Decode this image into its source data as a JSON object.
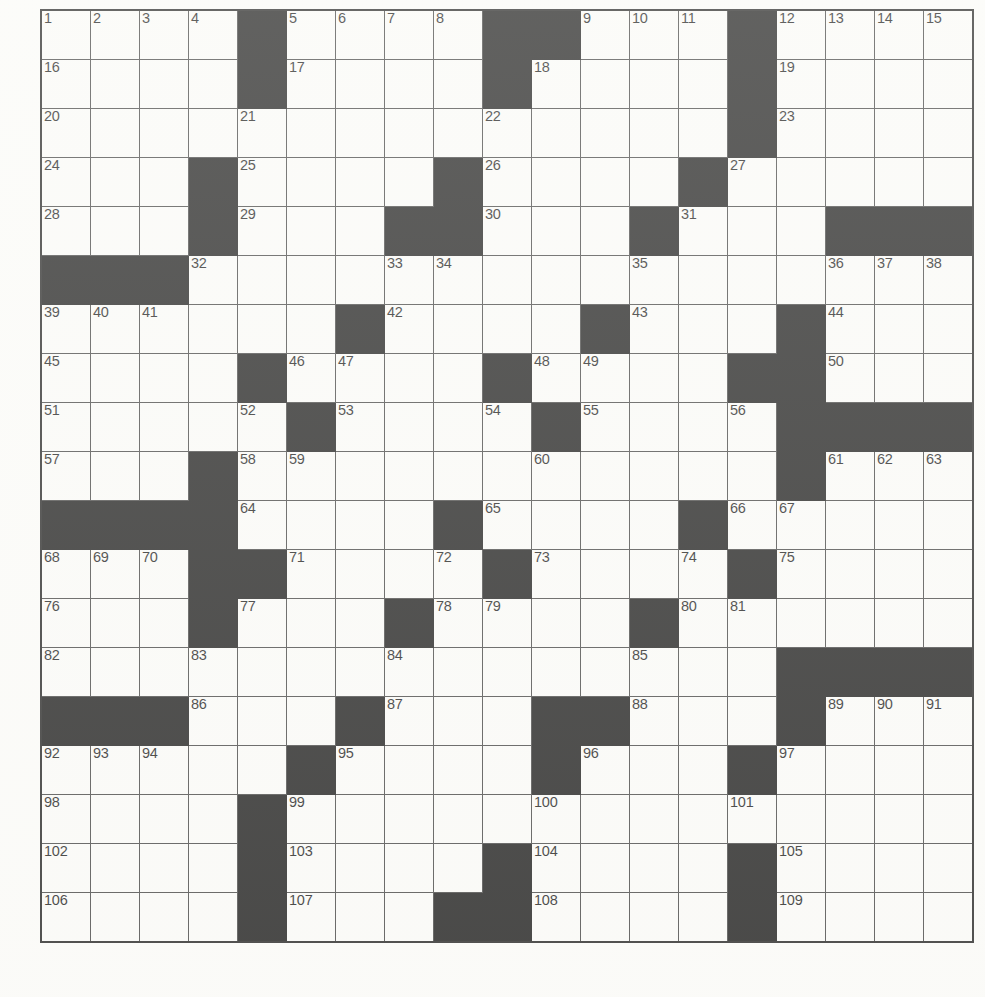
{
  "document": {
    "type": "crossword-puzzle-grid",
    "title": "Crossword Puzzle Grid",
    "rows": 19,
    "cols": 19,
    "colors": {
      "block": "#101010",
      "cell": "#fcfcfa",
      "grid_line": "#3c3c3c",
      "number_text": "#111111"
    },
    "max_clue_number": 109
  },
  "grid": {
    "legend": {
      "0": "white-cell",
      "1": "black-block"
    },
    "cells": [
      [
        0,
        0,
        0,
        0,
        1,
        0,
        0,
        0,
        0,
        1,
        1,
        0,
        0,
        0,
        1,
        0,
        0,
        0,
        0
      ],
      [
        0,
        0,
        0,
        0,
        1,
        0,
        0,
        0,
        0,
        1,
        0,
        0,
        0,
        0,
        1,
        0,
        0,
        0,
        0
      ],
      [
        0,
        0,
        0,
        0,
        0,
        0,
        0,
        0,
        0,
        0,
        0,
        0,
        0,
        0,
        1,
        0,
        0,
        0,
        0
      ],
      [
        0,
        0,
        0,
        1,
        0,
        0,
        0,
        0,
        1,
        0,
        0,
        0,
        0,
        1,
        0,
        0,
        0,
        0,
        0
      ],
      [
        0,
        0,
        0,
        1,
        0,
        0,
        0,
        1,
        1,
        0,
        0,
        0,
        1,
        0,
        0,
        0,
        1,
        1,
        1
      ],
      [
        1,
        1,
        1,
        0,
        0,
        0,
        0,
        0,
        0,
        0,
        0,
        0,
        0,
        0,
        0,
        0,
        0,
        0,
        0
      ],
      [
        0,
        0,
        0,
        0,
        0,
        0,
        1,
        0,
        0,
        0,
        0,
        1,
        0,
        0,
        0,
        1,
        0,
        0,
        0
      ],
      [
        0,
        0,
        0,
        0,
        1,
        0,
        0,
        0,
        0,
        1,
        0,
        0,
        0,
        0,
        1,
        1,
        0,
        0,
        0
      ],
      [
        0,
        0,
        0,
        0,
        0,
        1,
        0,
        0,
        0,
        0,
        1,
        0,
        0,
        0,
        0,
        1,
        1,
        1,
        1
      ],
      [
        0,
        0,
        0,
        1,
        0,
        0,
        0,
        0,
        0,
        0,
        0,
        0,
        0,
        0,
        0,
        1,
        0,
        0,
        0
      ],
      [
        1,
        1,
        1,
        1,
        0,
        0,
        0,
        0,
        1,
        0,
        0,
        0,
        0,
        1,
        0,
        0,
        0,
        0,
        0
      ],
      [
        0,
        0,
        0,
        1,
        1,
        0,
        0,
        0,
        0,
        1,
        0,
        0,
        0,
        0,
        1,
        0,
        0,
        0,
        0
      ],
      [
        0,
        0,
        0,
        1,
        0,
        0,
        0,
        1,
        0,
        0,
        0,
        0,
        1,
        0,
        0,
        0,
        0,
        0,
        0
      ],
      [
        0,
        0,
        0,
        0,
        0,
        0,
        0,
        0,
        0,
        0,
        0,
        0,
        0,
        0,
        0,
        1,
        1,
        1,
        1
      ],
      [
        1,
        1,
        1,
        0,
        0,
        0,
        1,
        0,
        0,
        0,
        1,
        1,
        0,
        0,
        0,
        1,
        0,
        0,
        0
      ],
      [
        0,
        0,
        0,
        0,
        0,
        1,
        0,
        0,
        0,
        0,
        1,
        0,
        0,
        0,
        1,
        0,
        0,
        0,
        0
      ],
      [
        0,
        0,
        0,
        0,
        1,
        0,
        0,
        0,
        0,
        0,
        0,
        0,
        0,
        0,
        0,
        0,
        0,
        0,
        0
      ],
      [
        0,
        0,
        0,
        0,
        1,
        0,
        0,
        0,
        0,
        1,
        0,
        0,
        0,
        0,
        1,
        0,
        0,
        0,
        0
      ],
      [
        0,
        0,
        0,
        0,
        1,
        0,
        0,
        0,
        1,
        1,
        0,
        0,
        0,
        0,
        1,
        0,
        0,
        0,
        0
      ]
    ],
    "numbers": [
      {
        "r": 0,
        "c": 0,
        "n": "1"
      },
      {
        "r": 0,
        "c": 1,
        "n": "2"
      },
      {
        "r": 0,
        "c": 2,
        "n": "3"
      },
      {
        "r": 0,
        "c": 3,
        "n": "4"
      },
      {
        "r": 0,
        "c": 5,
        "n": "5"
      },
      {
        "r": 0,
        "c": 6,
        "n": "6"
      },
      {
        "r": 0,
        "c": 7,
        "n": "7"
      },
      {
        "r": 0,
        "c": 8,
        "n": "8"
      },
      {
        "r": 0,
        "c": 11,
        "n": "9"
      },
      {
        "r": 0,
        "c": 12,
        "n": "10"
      },
      {
        "r": 0,
        "c": 13,
        "n": "11"
      },
      {
        "r": 0,
        "c": 15,
        "n": "12"
      },
      {
        "r": 0,
        "c": 16,
        "n": "13"
      },
      {
        "r": 0,
        "c": 17,
        "n": "14"
      },
      {
        "r": 0,
        "c": 18,
        "n": "15"
      },
      {
        "r": 1,
        "c": 0,
        "n": "16"
      },
      {
        "r": 1,
        "c": 5,
        "n": "17"
      },
      {
        "r": 1,
        "c": 10,
        "n": "18"
      },
      {
        "r": 1,
        "c": 15,
        "n": "19"
      },
      {
        "r": 2,
        "c": 0,
        "n": "20"
      },
      {
        "r": 2,
        "c": 4,
        "n": "21"
      },
      {
        "r": 2,
        "c": 9,
        "n": "22"
      },
      {
        "r": 2,
        "c": 15,
        "n": "23"
      },
      {
        "r": 3,
        "c": 0,
        "n": "24"
      },
      {
        "r": 3,
        "c": 4,
        "n": "25"
      },
      {
        "r": 3,
        "c": 9,
        "n": "26"
      },
      {
        "r": 3,
        "c": 14,
        "n": "27"
      },
      {
        "r": 4,
        "c": 0,
        "n": "28"
      },
      {
        "r": 4,
        "c": 4,
        "n": "29"
      },
      {
        "r": 4,
        "c": 9,
        "n": "30"
      },
      {
        "r": 4,
        "c": 13,
        "n": "31"
      },
      {
        "r": 5,
        "c": 3,
        "n": "32"
      },
      {
        "r": 5,
        "c": 7,
        "n": "33"
      },
      {
        "r": 5,
        "c": 8,
        "n": "34"
      },
      {
        "r": 5,
        "c": 12,
        "n": "35"
      },
      {
        "r": 5,
        "c": 16,
        "n": "36"
      },
      {
        "r": 5,
        "c": 17,
        "n": "37"
      },
      {
        "r": 5,
        "c": 18,
        "n": "38"
      },
      {
        "r": 6,
        "c": 0,
        "n": "39"
      },
      {
        "r": 6,
        "c": 1,
        "n": "40"
      },
      {
        "r": 6,
        "c": 2,
        "n": "41"
      },
      {
        "r": 6,
        "c": 7,
        "n": "42"
      },
      {
        "r": 6,
        "c": 12,
        "n": "43"
      },
      {
        "r": 6,
        "c": 16,
        "n": "44"
      },
      {
        "r": 7,
        "c": 0,
        "n": "45"
      },
      {
        "r": 7,
        "c": 5,
        "n": "46"
      },
      {
        "r": 7,
        "c": 6,
        "n": "47"
      },
      {
        "r": 7,
        "c": 10,
        "n": "48"
      },
      {
        "r": 7,
        "c": 11,
        "n": "49"
      },
      {
        "r": 7,
        "c": 16,
        "n": "50"
      },
      {
        "r": 8,
        "c": 0,
        "n": "51"
      },
      {
        "r": 8,
        "c": 4,
        "n": "52"
      },
      {
        "r": 8,
        "c": 6,
        "n": "53"
      },
      {
        "r": 8,
        "c": 9,
        "n": "54"
      },
      {
        "r": 8,
        "c": 11,
        "n": "55"
      },
      {
        "r": 8,
        "c": 14,
        "n": "56"
      },
      {
        "r": 9,
        "c": 0,
        "n": "57"
      },
      {
        "r": 9,
        "c": 4,
        "n": "58"
      },
      {
        "r": 9,
        "c": 5,
        "n": "59"
      },
      {
        "r": 9,
        "c": 10,
        "n": "60"
      },
      {
        "r": 9,
        "c": 16,
        "n": "61"
      },
      {
        "r": 9,
        "c": 17,
        "n": "62"
      },
      {
        "r": 9,
        "c": 18,
        "n": "63"
      },
      {
        "r": 10,
        "c": 4,
        "n": "64"
      },
      {
        "r": 10,
        "c": 9,
        "n": "65"
      },
      {
        "r": 10,
        "c": 14,
        "n": "66"
      },
      {
        "r": 10,
        "c": 15,
        "n": "67"
      },
      {
        "r": 11,
        "c": 0,
        "n": "68"
      },
      {
        "r": 11,
        "c": 1,
        "n": "69"
      },
      {
        "r": 11,
        "c": 2,
        "n": "70"
      },
      {
        "r": 11,
        "c": 5,
        "n": "71"
      },
      {
        "r": 11,
        "c": 8,
        "n": "72"
      },
      {
        "r": 11,
        "c": 10,
        "n": "73"
      },
      {
        "r": 11,
        "c": 13,
        "n": "74"
      },
      {
        "r": 11,
        "c": 15,
        "n": "75"
      },
      {
        "r": 12,
        "c": 0,
        "n": "76"
      },
      {
        "r": 12,
        "c": 4,
        "n": "77"
      },
      {
        "r": 12,
        "c": 8,
        "n": "78"
      },
      {
        "r": 12,
        "c": 9,
        "n": "79"
      },
      {
        "r": 12,
        "c": 13,
        "n": "80"
      },
      {
        "r": 12,
        "c": 14,
        "n": "81"
      },
      {
        "r": 13,
        "c": 0,
        "n": "82"
      },
      {
        "r": 13,
        "c": 3,
        "n": "83"
      },
      {
        "r": 13,
        "c": 7,
        "n": "84"
      },
      {
        "r": 13,
        "c": 12,
        "n": "85"
      },
      {
        "r": 14,
        "c": 3,
        "n": "86"
      },
      {
        "r": 14,
        "c": 7,
        "n": "87"
      },
      {
        "r": 14,
        "c": 12,
        "n": "88"
      },
      {
        "r": 14,
        "c": 16,
        "n": "89"
      },
      {
        "r": 14,
        "c": 17,
        "n": "90"
      },
      {
        "r": 14,
        "c": 18,
        "n": "91"
      },
      {
        "r": 15,
        "c": 0,
        "n": "92"
      },
      {
        "r": 15,
        "c": 1,
        "n": "93"
      },
      {
        "r": 15,
        "c": 2,
        "n": "94"
      },
      {
        "r": 15,
        "c": 6,
        "n": "95"
      },
      {
        "r": 15,
        "c": 11,
        "n": "96"
      },
      {
        "r": 15,
        "c": 15,
        "n": "97"
      },
      {
        "r": 16,
        "c": 0,
        "n": "98"
      },
      {
        "r": 16,
        "c": 5,
        "n": "99"
      },
      {
        "r": 16,
        "c": 10,
        "n": "100"
      },
      {
        "r": 16,
        "c": 14,
        "n": "101"
      },
      {
        "r": 17,
        "c": 0,
        "n": "102"
      },
      {
        "r": 17,
        "c": 5,
        "n": "103"
      },
      {
        "r": 17,
        "c": 10,
        "n": "104"
      },
      {
        "r": 17,
        "c": 15,
        "n": "105"
      },
      {
        "r": 18,
        "c": 0,
        "n": "106"
      },
      {
        "r": 18,
        "c": 5,
        "n": "107"
      },
      {
        "r": 18,
        "c": 10,
        "n": "108"
      },
      {
        "r": 18,
        "c": 15,
        "n": "109"
      }
    ]
  }
}
